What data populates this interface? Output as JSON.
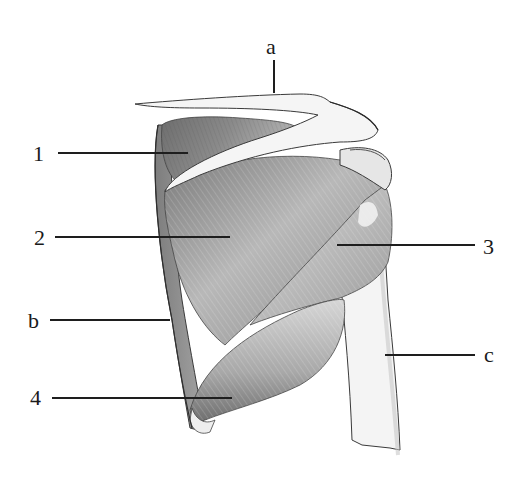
{
  "figure": {
    "style": "pencil illustration",
    "colors": {
      "background": "#ffffff",
      "ink": "#1e1e1e",
      "shade_dark": "#5a5a5a",
      "shade_mid": "#9a9a9a",
      "shade_light": "#d4d4d4",
      "bone": "#f2f2f2"
    }
  },
  "labels": {
    "numbers": [
      {
        "id": "1",
        "text": "1",
        "x": 35,
        "y": 145,
        "line_from": 58,
        "line_to": 188,
        "line_y": 152
      },
      {
        "id": "2",
        "text": "2",
        "x": 35,
        "y": 228,
        "line_from": 55,
        "line_to": 230,
        "line_y": 236
      },
      {
        "id": "3",
        "text": "3",
        "x": 483,
        "y": 236,
        "line_from": 337,
        "line_to": 475,
        "line_y": 244
      },
      {
        "id": "4",
        "text": "4",
        "x": 30,
        "y": 388,
        "line_from": 52,
        "line_to": 232,
        "line_y": 397
      }
    ],
    "letters": [
      {
        "id": "a",
        "text": "a",
        "x": 267,
        "y": 35
      },
      {
        "id": "b",
        "text": "b",
        "x": 28,
        "y": 313,
        "line_from": 50,
        "line_to": 170,
        "line_y": 319
      },
      {
        "id": "c",
        "text": "c",
        "x": 484,
        "y": 346,
        "line_from": 385,
        "line_to": 475,
        "line_y": 354
      }
    ]
  }
}
